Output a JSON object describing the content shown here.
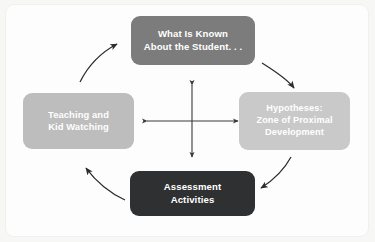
{
  "diagram": {
    "type": "cycle-diagram",
    "background_color": "#f7f7f6",
    "panel_color": "#fdfdfd",
    "nodes": [
      {
        "id": "known",
        "name": "what-is-known-node",
        "lines": [
          "What Is Known",
          "About the Student. . ."
        ],
        "color": "#7c7c7c",
        "text_color": "#ffffff",
        "position": "top"
      },
      {
        "id": "hypotheses",
        "name": "hypotheses-node",
        "lines": [
          "Hypotheses:",
          "Zone of Proximal",
          "Development"
        ],
        "color": "#c9c9c9",
        "text_color": "#ffffff",
        "position": "right"
      },
      {
        "id": "assessment",
        "name": "assessment-activities-node",
        "lines": [
          "Assessment",
          "Activities"
        ],
        "color": "#2f3031",
        "text_color": "#ffffff",
        "position": "bottom"
      },
      {
        "id": "teaching",
        "name": "teaching-kid-watching-node",
        "lines": [
          "Teaching and",
          "Kid Watching"
        ],
        "color": "#bdbdbd",
        "text_color": "#ffffff",
        "position": "left"
      }
    ],
    "arrows": [
      {
        "name": "arrow-known-to-hypotheses",
        "from": "known",
        "to": "hypotheses",
        "style": "curved",
        "direction": "clockwise"
      },
      {
        "name": "arrow-hypotheses-to-assessment",
        "from": "hypotheses",
        "to": "assessment",
        "style": "curved",
        "direction": "clockwise"
      },
      {
        "name": "arrow-assessment-to-teaching",
        "from": "assessment",
        "to": "teaching",
        "style": "curved",
        "direction": "clockwise"
      },
      {
        "name": "arrow-teaching-to-known",
        "from": "teaching",
        "to": "known",
        "style": "curved",
        "direction": "clockwise"
      }
    ],
    "center_arrow": {
      "name": "four-way-cross-arrow",
      "style": "double-headed-cross",
      "color": "#3a3a3a",
      "heads": [
        "up",
        "down",
        "left",
        "right"
      ]
    }
  }
}
